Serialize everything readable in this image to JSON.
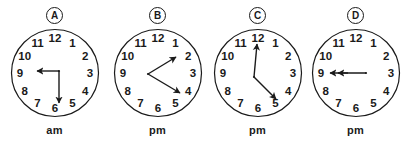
{
  "background_color": "#ffffff",
  "ink_color": "#1a1a1a",
  "dial": {
    "numerals": [
      "12",
      "1",
      "2",
      "3",
      "4",
      "5",
      "6",
      "7",
      "8",
      "9",
      "10",
      "11"
    ]
  },
  "clocks": [
    {
      "tag": "A",
      "meridiem": "am",
      "pivot": {
        "x": 50,
        "y": 44
      },
      "hands": [
        {
          "name": "hour-hand",
          "points_to": "9",
          "length": "short",
          "angle_deg": 270,
          "tip_x": 26,
          "tip_y": 44
        },
        {
          "name": "minute-hand",
          "points_to": "6",
          "length": "long",
          "angle_deg": 180,
          "tip_x": 50,
          "tip_y": 78
        }
      ]
    },
    {
      "tag": "B",
      "meridiem": "pm",
      "pivot": {
        "x": 36,
        "y": 47
      },
      "hands": [
        {
          "name": "hour-hand",
          "points_to": "2",
          "length": "short",
          "angle_deg": 60,
          "tip_x": 66,
          "tip_y": 29
        },
        {
          "name": "minute-hand",
          "points_to": "4",
          "length": "long",
          "angle_deg": 120,
          "tip_x": 70,
          "tip_y": 68
        }
      ]
    },
    {
      "tag": "C",
      "meridiem": "pm",
      "pivot": {
        "x": 42,
        "y": 50
      },
      "hands": [
        {
          "name": "minute-hand",
          "points_to": "12",
          "length": "long",
          "angle_deg": 0,
          "tip_x": 45,
          "tip_y": 14
        },
        {
          "name": "hour-hand",
          "points_to": "5",
          "length": "short",
          "angle_deg": 150,
          "tip_x": 66,
          "tip_y": 74
        }
      ]
    },
    {
      "tag": "D",
      "meridiem": "pm",
      "pivot": {
        "x": 56,
        "y": 46
      },
      "hands": [
        {
          "name": "minute-hand",
          "points_to": "9",
          "length": "long",
          "angle_deg": 270,
          "tip_x": 17,
          "tip_y": 46
        },
        {
          "name": "hour-hand",
          "points_to": "9",
          "length": "short",
          "angle_deg": 270,
          "tip_x": 25,
          "tip_y": 46
        }
      ]
    }
  ]
}
